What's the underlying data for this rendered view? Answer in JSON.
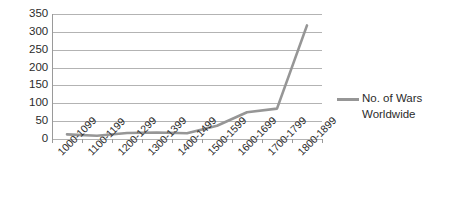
{
  "chart_data": {
    "type": "line",
    "title": "",
    "xlabel": "",
    "ylabel": "",
    "categories": [
      "1000-1099",
      "1100-1199",
      "1200-1299",
      "1300-1399",
      "1400-1499",
      "1500-1599",
      "1600-1699",
      "1700-1799",
      "1800-1899"
    ],
    "series": [
      {
        "name": "No. of Wars Worldwide",
        "values": [
          13,
          9,
          17,
          18,
          16,
          37,
          75,
          85,
          318
        ],
        "color": "#969696"
      }
    ],
    "ylim": [
      0,
      350
    ],
    "ytick_step": 50,
    "yticks": [
      350,
      300,
      250,
      200,
      150,
      100,
      50,
      0
    ],
    "grid": true,
    "grid_axis": "y",
    "legend_position": "right",
    "legend_entries": [
      "No. of Wars Worldwide"
    ]
  },
  "legend": {
    "line1": "No. of Wars",
    "line2": "Worldwide"
  },
  "colors": {
    "series": "#969696",
    "gridline": "#b3b3b3",
    "axis": "#9a9a9a",
    "text": "#2b2b2b",
    "background": "#ffffff"
  }
}
